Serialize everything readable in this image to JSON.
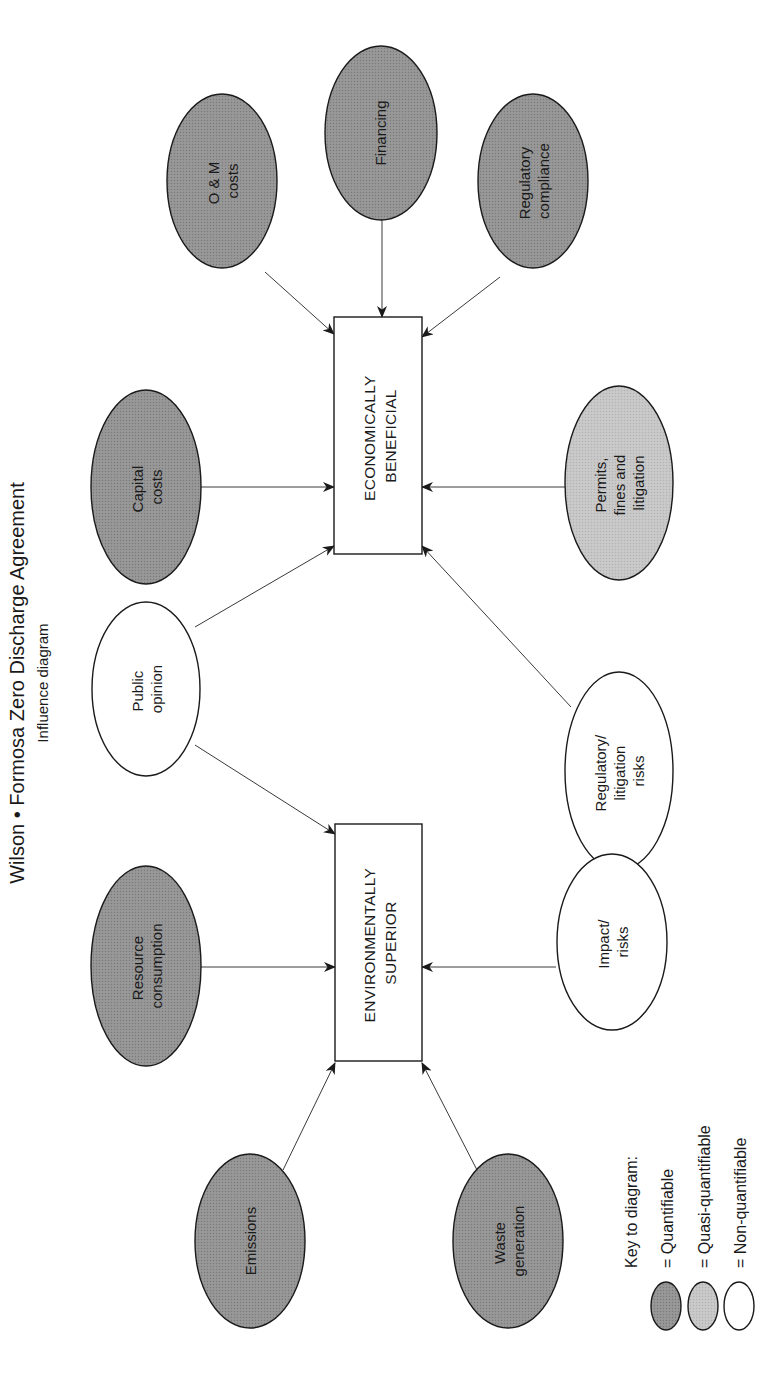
{
  "header": {
    "title": "Wilson • Formosa Zero Discharge Agreement",
    "subtitle": "Influence diagram"
  },
  "colors": {
    "quantifiable": "#8e8e8e",
    "quasi_quantifiable": "#c2c2c2",
    "non_quantifiable": "#ffffff",
    "stroke": "#1a1a1a"
  },
  "decisions": {
    "economically_beneficial": {
      "line1": "ECONOMICALLY",
      "line2": "BENEFICIAL"
    },
    "environmentally_superior": {
      "line1": "ENVIRONMENTALLY",
      "line2": "SUPERIOR"
    }
  },
  "nodes": {
    "om_costs": {
      "line1": "O & M",
      "line2": "costs",
      "type": "quantifiable"
    },
    "financing": {
      "line1": "Financing",
      "type": "quantifiable"
    },
    "regulatory_compliance": {
      "line1": "Regulatory",
      "line2": "compliance",
      "type": "quantifiable"
    },
    "capital_costs": {
      "line1": "Capital",
      "line2": "costs",
      "type": "quantifiable"
    },
    "permits_fines_litigation": {
      "line1": "Permits,",
      "line2": "fines and",
      "line3": "litigation",
      "type": "quasi-quantifiable"
    },
    "public_opinion": {
      "line1": "Public",
      "line2": "opinion",
      "type": "non-quantifiable"
    },
    "regulatory_litigation_risks": {
      "line1": "Regulatory/",
      "line2": "litigation",
      "line3": "risks",
      "type": "non-quantifiable"
    },
    "resource_consumption": {
      "line1": "Resource",
      "line2": "consumption",
      "type": "quantifiable"
    },
    "impact_risks": {
      "line1": "Impact/",
      "line2": "risks",
      "type": "non-quantifiable"
    },
    "emissions": {
      "line1": "Emissions",
      "type": "quantifiable"
    },
    "waste_generation": {
      "line1": "Waste",
      "line2": "generation",
      "type": "quantifiable"
    }
  },
  "edges": [
    {
      "from": "O & M costs",
      "to": "ECONOMICALLY BENEFICIAL"
    },
    {
      "from": "Financing",
      "to": "ECONOMICALLY BENEFICIAL"
    },
    {
      "from": "Regulatory compliance",
      "to": "ECONOMICALLY BENEFICIAL"
    },
    {
      "from": "Capital costs",
      "to": "ECONOMICALLY BENEFICIAL"
    },
    {
      "from": "Permits, fines and litigation",
      "to": "ECONOMICALLY BENEFICIAL"
    },
    {
      "from": "Public opinion",
      "to": "ECONOMICALLY BENEFICIAL"
    },
    {
      "from": "Regulatory/litigation risks",
      "to": "ECONOMICALLY BENEFICIAL"
    },
    {
      "from": "Public opinion",
      "to": "ENVIRONMENTALLY SUPERIOR"
    },
    {
      "from": "Resource consumption",
      "to": "ENVIRONMENTALLY SUPERIOR"
    },
    {
      "from": "Impact/risks",
      "to": "ENVIRONMENTALLY SUPERIOR"
    },
    {
      "from": "Emissions",
      "to": "ENVIRONMENTALLY SUPERIOR"
    },
    {
      "from": "Waste generation",
      "to": "ENVIRONMENTALLY SUPERIOR"
    }
  ],
  "legend": {
    "title": "Key to diagram:",
    "items": [
      {
        "label": "= Quantifiable",
        "color": "#8e8e8e"
      },
      {
        "label": "= Quasi-quantifiable",
        "color": "#c2c2c2"
      },
      {
        "label": "= Non-quantifiable",
        "color": "#ffffff"
      }
    ]
  }
}
